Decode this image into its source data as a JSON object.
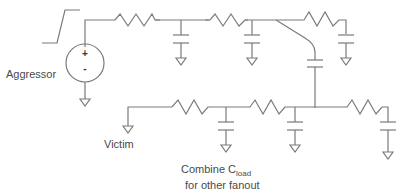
{
  "diagram": {
    "type": "crosstalk-rc-network",
    "labels": {
      "aggressor": "Aggressor",
      "victim": "Victim",
      "combine_main": "Combine C",
      "combine_sub": "load",
      "combine_line2": "for other fanout"
    },
    "source": {
      "plus": "+",
      "minus": "-"
    },
    "colors": {
      "wire": "#7a7a7a",
      "text": "#4a4a4a",
      "background": "#ffffff"
    },
    "aggressor_net": {
      "resistors": 3,
      "ground_caps": 3
    },
    "victim_net": {
      "resistors": 3,
      "ground_caps": 3
    },
    "coupling_caps": 1
  }
}
